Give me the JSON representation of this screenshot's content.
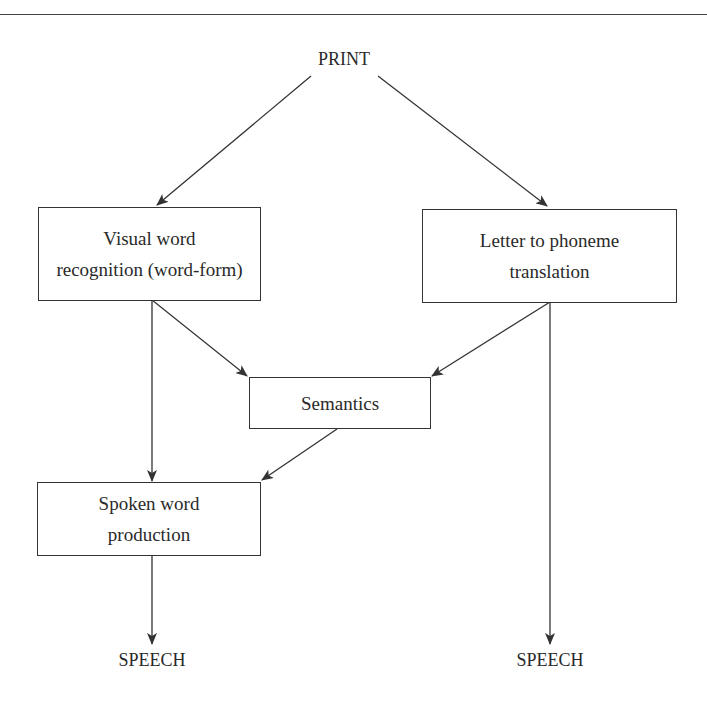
{
  "diagram": {
    "type": "flowchart",
    "input_node": {
      "id": "print",
      "label": "PRINT"
    },
    "nodes": [
      {
        "id": "visual_word",
        "label_lines": [
          "Visual word",
          "recognition (word-form)"
        ]
      },
      {
        "id": "letter_phoneme",
        "label_lines": [
          "Letter to phoneme",
          "translation"
        ]
      },
      {
        "id": "semantics",
        "label_lines": [
          "Semantics"
        ]
      },
      {
        "id": "spoken_word",
        "label_lines": [
          "Spoken word",
          "production"
        ]
      }
    ],
    "outputs": [
      {
        "id": "speech_left",
        "label": "SPEECH"
      },
      {
        "id": "speech_right",
        "label": "SPEECH"
      }
    ],
    "edges": [
      {
        "from": "print",
        "to": "visual_word"
      },
      {
        "from": "print",
        "to": "letter_phoneme"
      },
      {
        "from": "visual_word",
        "to": "semantics"
      },
      {
        "from": "visual_word",
        "to": "spoken_word"
      },
      {
        "from": "letter_phoneme",
        "to": "semantics"
      },
      {
        "from": "letter_phoneme",
        "to": "speech_right"
      },
      {
        "from": "semantics",
        "to": "spoken_word"
      },
      {
        "from": "spoken_word",
        "to": "speech_left"
      }
    ]
  },
  "colors": {
    "line": "#333333",
    "text": "#2a2a2a",
    "background": "#ffffff"
  }
}
